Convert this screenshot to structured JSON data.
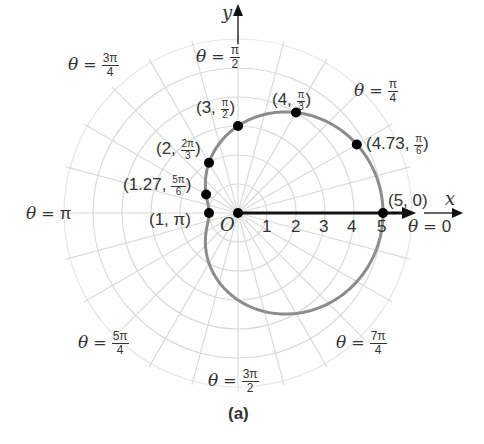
{
  "chart_data": {
    "type": "line",
    "coordinate_system": "polar",
    "title": "",
    "caption": "(a)",
    "equation_implied": "r = 3 + 2cos(theta)",
    "xlabel": "x",
    "ylabel": "y",
    "origin_label": "O",
    "radial_tick_labels": [
      "1",
      "2",
      "3",
      "4",
      "5"
    ],
    "radial_range": [
      0,
      6
    ],
    "angle_grid_step": "pi/12",
    "grid": true,
    "angle_labels": [
      {
        "text_prefix": "θ = ",
        "num": "π",
        "den": "2",
        "angle_deg": 90
      },
      {
        "text_prefix": "θ = ",
        "num": "π",
        "den": "4",
        "angle_deg": 45
      },
      {
        "text_prefix": "θ = ",
        "num": "3π",
        "den": "4",
        "angle_deg": 135
      },
      {
        "text_prefix": "θ = ",
        "value": "π",
        "angle_deg": 180
      },
      {
        "text_prefix": "θ = ",
        "value": "0",
        "angle_deg": 0
      },
      {
        "text_prefix": "θ = ",
        "num": "5π",
        "den": "4",
        "angle_deg": 225
      },
      {
        "text_prefix": "θ = ",
        "num": "3π",
        "den": "2",
        "angle_deg": 270
      },
      {
        "text_prefix": "θ = ",
        "num": "7π",
        "den": "4",
        "angle_deg": 315
      }
    ],
    "points": [
      {
        "r": 5,
        "theta": "0",
        "theta_deg": 0,
        "label_r": "5",
        "label_num": "0"
      },
      {
        "r": 4.73,
        "theta": "π/6",
        "theta_deg": 30,
        "label_r": "4.73",
        "label_num": "π",
        "label_den": "6"
      },
      {
        "r": 4,
        "theta": "π/3",
        "theta_deg": 60,
        "label_r": "4",
        "label_num": "π",
        "label_den": "3"
      },
      {
        "r": 3,
        "theta": "π/2",
        "theta_deg": 90,
        "label_r": "3",
        "label_num": "π",
        "label_den": "2"
      },
      {
        "r": 2,
        "theta": "2π/3",
        "theta_deg": 120,
        "label_r": "2",
        "label_num": "2π",
        "label_den": "3"
      },
      {
        "r": 1.27,
        "theta": "5π/6",
        "theta_deg": 150,
        "label_r": "1.27",
        "label_num": "5π",
        "label_den": "6"
      },
      {
        "r": 1,
        "theta": "π",
        "theta_deg": 180,
        "label_r": "1",
        "label_num": "π"
      }
    ],
    "curve_color": "#8c8c8c",
    "grid_color": "#d9d9d9",
    "point_color": "#000000"
  },
  "labels": {
    "y_axis": "y",
    "x_axis": "x",
    "origin": "O",
    "theta": "θ",
    "equals": "=",
    "pi_half_num": "π",
    "pi_half_den": "2",
    "pi_quarter_num": "π",
    "pi_quarter_den": "4",
    "three_pi_quarter_num": "3π",
    "three_pi_quarter_den": "4",
    "pi": "π",
    "zero": "0",
    "five_pi_quarter_num": "5π",
    "five_pi_quarter_den": "4",
    "three_pi_half_num": "3π",
    "three_pi_half_den": "2",
    "seven_pi_quarter_num": "7π",
    "seven_pi_quarter_den": "4",
    "ticks": [
      "1",
      "2",
      "3",
      "4",
      "5"
    ],
    "caption": "(a)",
    "pt_5_0": "(5, 0)",
    "pt_473_r": "(4.73, ",
    "pt_473_num": "π",
    "pt_473_den": "6",
    "pt_4_r": "(4, ",
    "pt_4_num": "π",
    "pt_4_den": "3",
    "pt_3_r": "(3, ",
    "pt_3_num": "π",
    "pt_3_den": "2",
    "pt_2_r": "(2, ",
    "pt_2_num": "2π",
    "pt_2_den": "3",
    "pt_127_r": "(1.27, ",
    "pt_127_num": "5π",
    "pt_127_den": "6",
    "pt_1": "(1, π)",
    "close_paren": ")"
  }
}
